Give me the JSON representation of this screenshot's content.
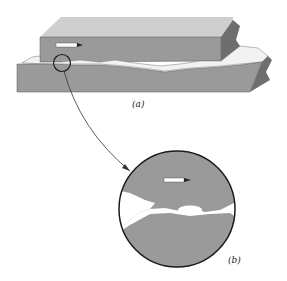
{
  "figure": {
    "panel_a": {
      "label": "(a)",
      "description": "Two rough surfaces in contact, upper block sliding over lower block"
    },
    "panel_b": {
      "label": "(b)",
      "description": "Magnified view of contact junction between asperities"
    },
    "colors": {
      "block": "#9a9a9a",
      "block_dark": "#6e6e6e",
      "block_side": "#7d7d7d",
      "gap": "#ffffff",
      "outline": "#1a1a1a",
      "arrow": "#ffffff"
    }
  }
}
